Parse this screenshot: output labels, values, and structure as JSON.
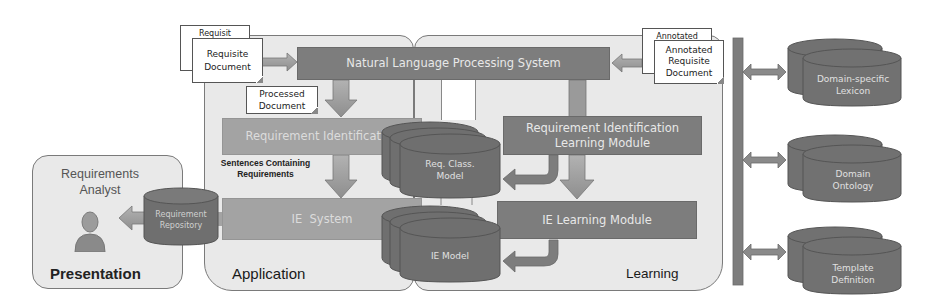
{
  "diagram": {
    "panels": {
      "presentation": {
        "title": "Presentation",
        "actor": "Requirements\nAnalyst"
      },
      "application": {
        "title": "Application"
      },
      "learning": {
        "title": "Learning"
      }
    },
    "documents": {
      "requisite_back": "Requisit",
      "requisite": "Requisite\nDocument",
      "processed": "Processed\nDocument",
      "annotated_back": "Annotated",
      "annotated": "Annotated\nRequisite\nDocument"
    },
    "modules": {
      "nlp": "Natural Language Processing System",
      "req_identification": "Requirement Identification",
      "ie_system": "IE  System",
      "ri_learning": "Requirement Identification\nLearning Module",
      "ie_learning": "IE Learning Module"
    },
    "stores": {
      "req_class_model": "Req. Class.\nModel",
      "ie_model": "IE Model",
      "requirement_repository": "Requirement\nRepository",
      "domain_lexicon": "Domain-specific\nLexicon",
      "domain_ontology": "Domain\nOntology",
      "template_definition": "Template\nDefinition"
    },
    "annotations": {
      "sentences": "Sentences Containing\nRequirements"
    },
    "colors": {
      "panel_fill": "#e9e9e9",
      "module_dark": "#7d7d7d",
      "module_light": "#a3a3a3",
      "store": "#6f6f6f",
      "arrow": "#9a9a9a"
    }
  }
}
